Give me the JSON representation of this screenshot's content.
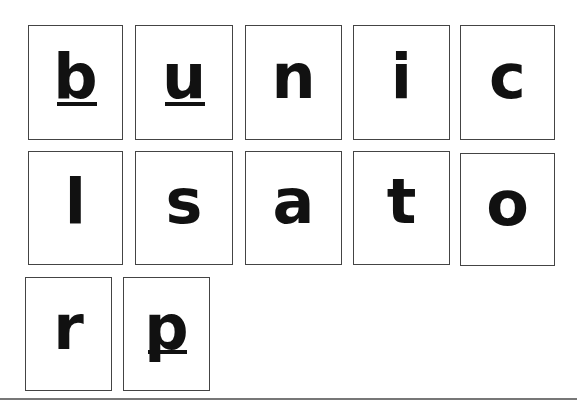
{
  "cards": [
    {
      "letter": "b",
      "marked": true
    },
    {
      "letter": "u",
      "marked": true
    },
    {
      "letter": "n",
      "marked": false
    },
    {
      "letter": "i",
      "marked": false
    },
    {
      "letter": "c",
      "marked": false
    },
    {
      "letter": "l",
      "marked": false
    },
    {
      "letter": "s",
      "marked": false
    },
    {
      "letter": "a",
      "marked": false
    },
    {
      "letter": "t",
      "marked": false
    },
    {
      "letter": "o",
      "marked": false
    },
    {
      "letter": "r",
      "marked": false
    },
    {
      "letter": "p",
      "marked": true
    }
  ]
}
